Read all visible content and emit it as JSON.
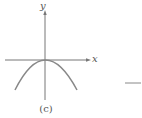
{
  "figure": {
    "caption": "(c)",
    "axes": {
      "x_label": "x",
      "y_label": "y"
    },
    "curve": {
      "description": "downward-opening parabola with vertex at origin",
      "equation_shape": "y = -k x^2"
    },
    "adjacent_mark": "short horizontal dash (fragment of neighboring figure)",
    "colors": {
      "axis": "#777777",
      "curve": "#888888",
      "text": "#555555",
      "background": "#ffffff"
    }
  }
}
